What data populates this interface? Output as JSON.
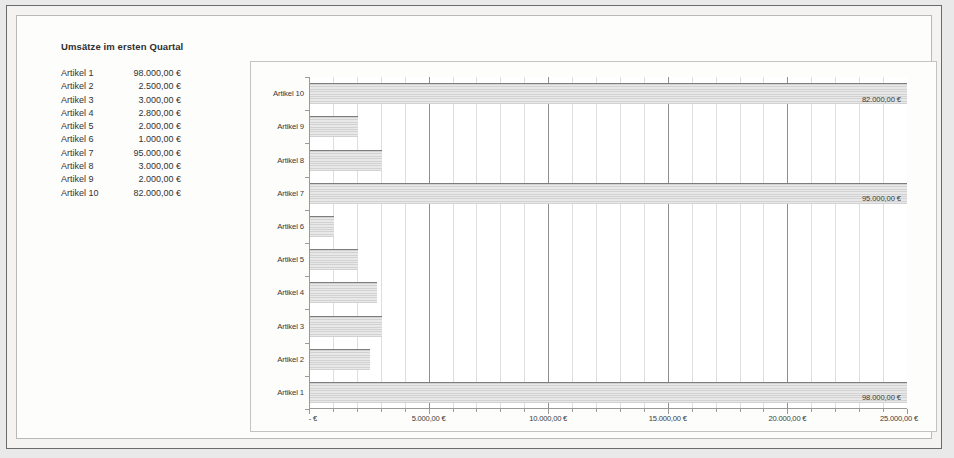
{
  "document": {
    "title": "Umsätze im ersten Quartal"
  },
  "table": {
    "rows": [
      {
        "label": "Artikel 1",
        "value": "98.000,00 €"
      },
      {
        "label": "Artikel 2",
        "value": "2.500,00 €"
      },
      {
        "label": "Artikel 3",
        "value": "3.000,00 €"
      },
      {
        "label": "Artikel 4",
        "value": "2.800,00 €"
      },
      {
        "label": "Artikel 5",
        "value": "2.000,00 €"
      },
      {
        "label": "Artikel 6",
        "value": "1.000,00 €"
      },
      {
        "label": "Artikel 7",
        "value": "95.000,00 €"
      },
      {
        "label": "Artikel 8",
        "value": "3.000,00 €"
      },
      {
        "label": "Artikel 9",
        "value": "2.000,00 €"
      },
      {
        "label": "Artikel 10",
        "value": "82.000,00 €"
      }
    ]
  },
  "chart_data": {
    "type": "bar",
    "orientation": "horizontal",
    "title": "",
    "xlabel": "",
    "ylabel": "",
    "categories": [
      "Artikel 1",
      "Artikel 2",
      "Artikel 3",
      "Artikel 4",
      "Artikel 5",
      "Artikel 6",
      "Artikel 7",
      "Artikel 8",
      "Artikel 9",
      "Artikel 10"
    ],
    "values": [
      98000,
      2500,
      3000,
      2800,
      2000,
      1000,
      95000,
      3000,
      2000,
      82000
    ],
    "data_labels": {
      "Artikel 1": "98.000,00 €",
      "Artikel 7": "95.000,00 €",
      "Artikel 10": "82.000,00 €"
    },
    "xlim": [
      0,
      25000
    ],
    "xticks": [
      0,
      5000,
      10000,
      15000,
      20000,
      25000
    ],
    "xticklabels": [
      "-  €",
      "5.000,00 €",
      "10.000,00 €",
      "15.000,00 €",
      "20.000,00 €",
      "25.000,00 €"
    ],
    "minor_tick_interval": 1000,
    "grid": {
      "major_vertical": true,
      "minor_vertical": true,
      "horizontal": false
    },
    "legend": {
      "visible": false
    },
    "bar_fill_color": "#dcdcdc",
    "bar_edge_color": "#7d7d7d",
    "note": "Bars for Artikel 1, 7 and 10 exceed the axis maximum of 25.000 and are clipped at the plot edge; their true values are shown as data labels."
  }
}
